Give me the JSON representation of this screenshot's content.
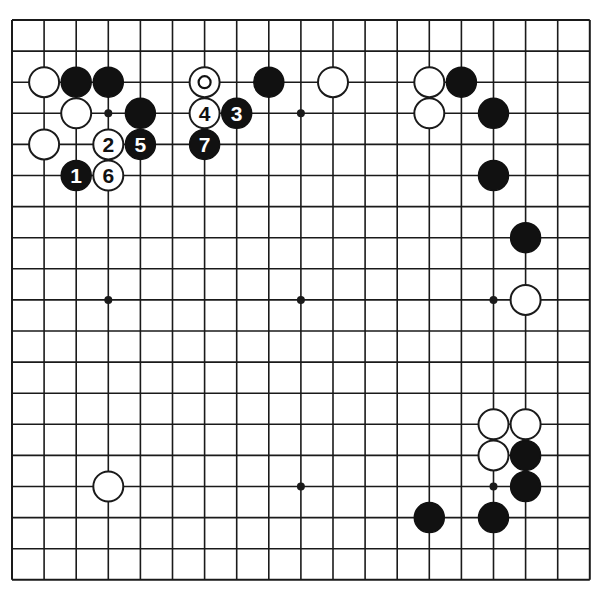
{
  "diagram": {
    "type": "go-board",
    "size": 19,
    "geometry": {
      "origin_x": 12,
      "origin_y": 20,
      "step_x": 32.1,
      "step_y": 31.1,
      "stone_radius": 15
    },
    "colors": {
      "line": "#1a1a1a",
      "black": "#111111",
      "white": "#ffffff",
      "background": "#ffffff"
    },
    "star_points": [
      [
        3,
        3
      ],
      [
        9,
        3
      ],
      [
        15,
        3
      ],
      [
        3,
        9
      ],
      [
        9,
        9
      ],
      [
        15,
        9
      ],
      [
        3,
        15
      ],
      [
        9,
        15
      ],
      [
        15,
        15
      ]
    ],
    "stones": [
      {
        "col": 1,
        "row": 2,
        "color": "white",
        "label": ""
      },
      {
        "col": 2,
        "row": 2,
        "color": "black",
        "label": ""
      },
      {
        "col": 3,
        "row": 2,
        "color": "black",
        "label": ""
      },
      {
        "col": 6,
        "row": 2,
        "color": "white",
        "label": "",
        "marker": "circle"
      },
      {
        "col": 8,
        "row": 2,
        "color": "black",
        "label": ""
      },
      {
        "col": 10,
        "row": 2,
        "color": "white",
        "label": ""
      },
      {
        "col": 13,
        "row": 2,
        "color": "white",
        "label": ""
      },
      {
        "col": 14,
        "row": 2,
        "color": "black",
        "label": ""
      },
      {
        "col": 2,
        "row": 3,
        "color": "white",
        "label": ""
      },
      {
        "col": 4,
        "row": 3,
        "color": "black",
        "label": ""
      },
      {
        "col": 6,
        "row": 3,
        "color": "white",
        "label": "4"
      },
      {
        "col": 7,
        "row": 3,
        "color": "black",
        "label": "3"
      },
      {
        "col": 13,
        "row": 3,
        "color": "white",
        "label": ""
      },
      {
        "col": 15,
        "row": 3,
        "color": "black",
        "label": ""
      },
      {
        "col": 1,
        "row": 4,
        "color": "white",
        "label": ""
      },
      {
        "col": 3,
        "row": 4,
        "color": "white",
        "label": "2"
      },
      {
        "col": 4,
        "row": 4,
        "color": "black",
        "label": "5"
      },
      {
        "col": 6,
        "row": 4,
        "color": "black",
        "label": "7"
      },
      {
        "col": 2,
        "row": 5,
        "color": "black",
        "label": "1"
      },
      {
        "col": 3,
        "row": 5,
        "color": "white",
        "label": "6"
      },
      {
        "col": 15,
        "row": 5,
        "color": "black",
        "label": ""
      },
      {
        "col": 16,
        "row": 7,
        "color": "black",
        "label": ""
      },
      {
        "col": 16,
        "row": 9,
        "color": "white",
        "label": ""
      },
      {
        "col": 15,
        "row": 13,
        "color": "white",
        "label": ""
      },
      {
        "col": 16,
        "row": 13,
        "color": "white",
        "label": ""
      },
      {
        "col": 15,
        "row": 14,
        "color": "white",
        "label": ""
      },
      {
        "col": 16,
        "row": 14,
        "color": "black",
        "label": ""
      },
      {
        "col": 16,
        "row": 15,
        "color": "black",
        "label": ""
      },
      {
        "col": 3,
        "row": 15,
        "color": "white",
        "label": ""
      },
      {
        "col": 13,
        "row": 16,
        "color": "black",
        "label": ""
      },
      {
        "col": 15,
        "row": 16,
        "color": "black",
        "label": ""
      }
    ],
    "move_sequence": [
      {
        "move": 1,
        "color": "black",
        "col": 2,
        "row": 5
      },
      {
        "move": 2,
        "color": "white",
        "col": 3,
        "row": 4
      },
      {
        "move": 3,
        "color": "black",
        "col": 7,
        "row": 3
      },
      {
        "move": 4,
        "color": "white",
        "col": 6,
        "row": 3
      },
      {
        "move": 5,
        "color": "black",
        "col": 4,
        "row": 4
      },
      {
        "move": 6,
        "color": "white",
        "col": 3,
        "row": 5
      },
      {
        "move": 7,
        "color": "black",
        "col": 6,
        "row": 4
      }
    ]
  }
}
